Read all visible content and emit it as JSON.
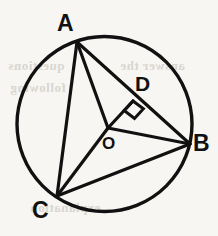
{
  "figure": {
    "kind": "circle-geometry-diagram",
    "background_color": "#f7f6f3",
    "stroke_color": "#111111",
    "circle": {
      "center_x": 104.5,
      "center_y": 124,
      "radius": 87.5,
      "stroke_width": 3.4
    },
    "points": {
      "A": {
        "x": 77,
        "y": 42,
        "on_circle": true
      },
      "B": {
        "x": 190,
        "y": 144,
        "on_circle": true
      },
      "C": {
        "x": 57,
        "y": 196,
        "on_circle": true
      },
      "O": {
        "x": 108,
        "y": 128,
        "on_circle": false,
        "role": "center"
      },
      "D": {
        "x": 133,
        "y": 101,
        "on_circle": false,
        "role": "foot-of-perpendicular"
      }
    },
    "segments": [
      {
        "name": "chord-AB",
        "from": "A",
        "to": "B"
      },
      {
        "name": "chord-AC",
        "from": "A",
        "to": "C"
      },
      {
        "name": "chord-CB",
        "from": "C",
        "to": "B"
      },
      {
        "name": "radius-OA",
        "from": "O",
        "to": "A"
      },
      {
        "name": "radius-OB",
        "from": "O",
        "to": "B"
      },
      {
        "name": "radius-OC",
        "from": "O",
        "to": "C"
      },
      {
        "name": "perpendicular-OD",
        "from": "O",
        "to": "D"
      }
    ],
    "right_angle": {
      "at_point": "D",
      "between": [
        "OD",
        "DB"
      ],
      "marker_size": 13
    }
  },
  "labels": {
    "A": "A",
    "B": "B",
    "C": "C",
    "D": "D",
    "O": "O"
  },
  "background_bleed": {
    "line1": "questions",
    "line2": "answer the",
    "line3": "following",
    "line4": "explanation"
  }
}
